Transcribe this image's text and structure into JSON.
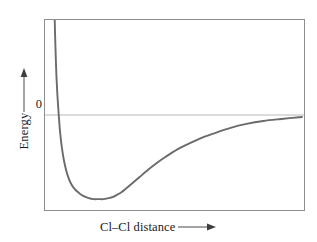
{
  "figure": {
    "type": "potential-energy-curve",
    "background_color": "#ffffff"
  },
  "axes": {
    "y_label": "Energy",
    "y_arrow_icon": "up-arrow-icon",
    "x_label": "Cl–Cl distance",
    "x_arrow_icon": "right-arrow-icon",
    "zero_tick_label": "0"
  },
  "style": {
    "curve_color": "#6b6b6b",
    "frame_color": "#8d8d8d",
    "zero_line_color": "#b9b9b9",
    "text_color": "#1a1a1a"
  },
  "chart_data": {
    "type": "line",
    "title": "",
    "xlabel": "Cl–Cl distance",
    "ylabel": "Energy",
    "grid": false,
    "legend": "none",
    "xlim": [
      0,
      261
    ],
    "ylim": [
      -96,
      96
    ],
    "axis_notes": {
      "x_axis": "Cl–Cl internuclear distance, increasing to the right, no numeric tick labels",
      "y_axis": "Potential energy, increasing upward, only the value 0 is labeled"
    },
    "annotations": [
      {
        "label": "0",
        "type": "y-tick",
        "y": 0
      }
    ],
    "reference_lines": [
      {
        "name": "zero-energy-line",
        "orientation": "horizontal",
        "y": 0,
        "color": "#b9b9b9"
      }
    ],
    "features": {
      "zero_crossing_x": 11.5,
      "minimum_x": 68,
      "minimum_y": -85,
      "asymptote_y": -2,
      "description": "Steeply repulsive at short distance, deep attractive minimum at the bond length, asymptotically approaching zero at long distance"
    },
    "series": [
      {
        "name": "Cl2 potential energy",
        "color": "#6b6b6b",
        "x": [
          9.8,
          10.2,
          10.8,
          11.5,
          12.4,
          13.5,
          15.0,
          17.0,
          19.5,
          22.5,
          26.0,
          30.0,
          34.5,
          39.0,
          44.0,
          49.0,
          54.0,
          59.0,
          64.0,
          68.0,
          72.0,
          77.0,
          82.0,
          88.0,
          95.0,
          103.0,
          112.0,
          122.0,
          133.0,
          145.0,
          158.0,
          172.0,
          187.0,
          203.0,
          220.0,
          238.0,
          259.0
        ],
        "y": [
          96,
          80,
          60,
          40,
          22,
          5,
          -15,
          -33,
          -48,
          -60,
          -69,
          -75,
          -79,
          -82,
          -84,
          -85,
          -85,
          -85,
          -84,
          -83,
          -81,
          -78,
          -74,
          -69,
          -63,
          -56,
          -49,
          -42,
          -35,
          -29,
          -23,
          -18,
          -13,
          -9,
          -6,
          -4,
          -2
        ]
      }
    ]
  }
}
